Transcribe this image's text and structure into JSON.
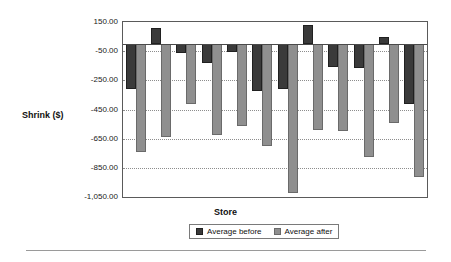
{
  "chart_data": {
    "type": "bar",
    "title": "",
    "xlabel": "Store",
    "ylabel": "Shrink ($)",
    "ylim": [
      -1050,
      150
    ],
    "grid": true,
    "legend_position": "bottom",
    "ytick_labels": [
      "150.00",
      "-50.00",
      "-250.00",
      "-450.00",
      "-650.00",
      "-850.00",
      "-1,050.00"
    ],
    "ytick_values": [
      150,
      -50,
      -250,
      -450,
      -650,
      -850,
      -1050
    ],
    "categories": [
      "1",
      "2",
      "3",
      "4",
      "5",
      "6",
      "7",
      "8",
      "9",
      "10",
      "11",
      "12"
    ],
    "series": [
      {
        "name": "Average before",
        "color": "#3a3a3a",
        "values": [
          -310,
          110,
          -60,
          -130,
          -55,
          -320,
          -310,
          130,
          -160,
          -165,
          45,
          -410
        ]
      },
      {
        "name": "Average after",
        "color": "#8f8f8f",
        "values": [
          -740,
          -640,
          -410,
          -625,
          -560,
          -700,
          -1020,
          -590,
          -600,
          -775,
          -545,
          -910
        ]
      }
    ]
  },
  "legend": {
    "items": [
      {
        "label": "Average before",
        "swatch": "before"
      },
      {
        "label": "Average after",
        "swatch": "after"
      }
    ]
  },
  "icons": {
    "legend_swatch_before": "filled-square-dark-icon",
    "legend_swatch_after": "filled-square-gray-icon"
  }
}
